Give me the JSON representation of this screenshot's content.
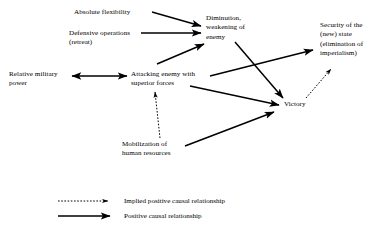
{
  "diagram": {
    "background_color": "#ffffff",
    "line_color": "#000000",
    "nodes": [
      {
        "id": "absolute_flexibility",
        "label": "Absolute flexibility",
        "x": 74,
        "y": 8,
        "align": "left"
      },
      {
        "id": "defensive_operations",
        "label": "Defensive operations\n(retreat)",
        "x": 69,
        "y": 29,
        "align": "left"
      },
      {
        "id": "diminution",
        "label": "Diminution,\nweakening of\nenemy",
        "x": 206,
        "y": 14,
        "align": "left"
      },
      {
        "id": "security_of_state",
        "label": "Security of the\n(new) state\n(elimination of\nimperialism)",
        "x": 320,
        "y": 21,
        "align": "left"
      },
      {
        "id": "relative_military_power",
        "label": "Relative military\npower",
        "x": 9,
        "y": 70,
        "align": "left"
      },
      {
        "id": "attacking_enemy",
        "label": "Attacking enemy with\nsuperior forces",
        "x": 131,
        "y": 70,
        "align": "left"
      },
      {
        "id": "victory",
        "label": "Victory",
        "x": 284,
        "y": 100,
        "align": "left"
      },
      {
        "id": "mobilization",
        "label": "Mobilization of\nhuman resources",
        "x": 122,
        "y": 140,
        "align": "left"
      }
    ],
    "edges": [
      {
        "id": "flexibility-to-diminution",
        "from": "absolute_flexibility",
        "to": "diminution",
        "style": "solid",
        "arrow": "single",
        "x1": 152,
        "y1": 12,
        "x2": 201,
        "y2": 26
      },
      {
        "id": "defensive-to-diminution",
        "from": "defensive_operations",
        "to": "diminution",
        "style": "solid",
        "arrow": "single",
        "x1": 141,
        "y1": 33,
        "x2": 201,
        "y2": 33
      },
      {
        "id": "attacking-to-diminution",
        "from": "attacking_enemy",
        "to": "diminution",
        "style": "solid",
        "arrow": "single",
        "x1": 157,
        "y1": 64,
        "x2": 204,
        "y2": 44
      },
      {
        "id": "power-to-attacking",
        "from": "relative_military_power",
        "to": "attacking_enemy",
        "style": "solid",
        "arrow": "double",
        "x1": 72,
        "y1": 76,
        "x2": 127,
        "y2": 76
      },
      {
        "id": "diminution-to-victory",
        "from": "diminution",
        "to": "victory",
        "style": "solid",
        "arrow": "single",
        "x1": 235,
        "y1": 42,
        "x2": 283,
        "y2": 98
      },
      {
        "id": "attacking-to-security",
        "from": "attacking_enemy",
        "to": "security_of_state",
        "style": "solid",
        "arrow": "single",
        "x1": 210,
        "y1": 76,
        "x2": 313,
        "y2": 50
      },
      {
        "id": "attacking-to-victory",
        "from": "attacking_enemy",
        "to": "victory",
        "style": "solid",
        "arrow": "single",
        "x1": 190,
        "y1": 86,
        "x2": 279,
        "y2": 105
      },
      {
        "id": "mobilization-to-victory",
        "from": "mobilization",
        "to": "victory",
        "style": "solid",
        "arrow": "single",
        "x1": 185,
        "y1": 146,
        "x2": 274,
        "y2": 112
      },
      {
        "id": "mobilization-to-attacking",
        "from": "mobilization",
        "to": "attacking_enemy",
        "style": "dashed",
        "arrow": "single",
        "x1": 160,
        "y1": 138,
        "x2": 155,
        "y2": 92
      },
      {
        "id": "victory-to-security",
        "from": "victory",
        "to": "security_of_state",
        "style": "dashed",
        "arrow": "single",
        "x1": 306,
        "y1": 98,
        "x2": 331,
        "y2": 69
      }
    ],
    "legend": [
      {
        "id": "implied-positive",
        "label": "Implied positive causal relationship",
        "style": "dashed",
        "line_x1": 58,
        "line_x2": 108,
        "line_y": 201,
        "label_x": 124,
        "label_y": 197
      },
      {
        "id": "positive",
        "label": "Positive causal relationship",
        "style": "solid",
        "line_x1": 58,
        "line_x2": 110,
        "line_y": 216,
        "label_x": 124,
        "label_y": 212
      }
    ]
  }
}
